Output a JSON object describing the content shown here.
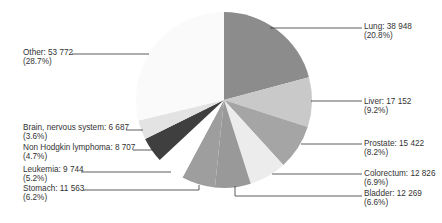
{
  "chart_data": {
    "type": "pie",
    "title": "",
    "center": [
      224,
      100
    ],
    "radius": 88,
    "start_angle_deg": 0,
    "direction": "clockwise",
    "slices": [
      {
        "label": "Lung",
        "value": 38948,
        "value_text": "38 948",
        "percent": 20.8,
        "percent_text": "(20.8%)",
        "color": "#8c8c8c",
        "side": "right",
        "label_x": 364,
        "label_y": 29,
        "line": [
          [
            270,
            28
          ],
          [
            362,
            28
          ]
        ]
      },
      {
        "label": "Liver",
        "value": 17152,
        "value_text": "17 152",
        "percent": 9.2,
        "percent_text": "(9.2%)",
        "color": "#c9c9c9",
        "side": "right",
        "label_x": 364,
        "label_y": 104,
        "line": [
          [
            311,
            101
          ],
          [
            362,
            101
          ]
        ]
      },
      {
        "label": "Prostate",
        "value": 15422,
        "value_text": "15 422",
        "percent": 8.2,
        "percent_text": "(8.2%)",
        "color": "#a5a5a5",
        "side": "right",
        "label_x": 364,
        "label_y": 146,
        "line": [
          [
            301,
            144
          ],
          [
            362,
            144
          ]
        ]
      },
      {
        "label": "Colorectum",
        "value": 12826,
        "value_text": "12 826",
        "percent": 6.9,
        "percent_text": "(6.9%)",
        "color": "#ececec",
        "side": "right",
        "label_x": 364,
        "label_y": 176,
        "line": [
          [
            272,
            174
          ],
          [
            362,
            174
          ]
        ]
      },
      {
        "label": "Bladder",
        "value": 12269,
        "value_text": "12 269",
        "percent": 6.6,
        "percent_text": "(6.6%)",
        "color": "#999999",
        "side": "right",
        "label_x": 364,
        "label_y": 196,
        "line": [
          [
            235,
            186
          ],
          [
            235,
            196
          ],
          [
            362,
            196
          ]
        ]
      },
      {
        "label": "Stomach",
        "value": 11563,
        "value_text": "11 563",
        "percent": 6.2,
        "percent_text": "(6.2%)",
        "color": "#9e9e9e",
        "side": "left",
        "label_x": 23,
        "label_y": 191,
        "line": [
          [
            83,
            190
          ],
          [
            199,
            190
          ],
          [
            199,
            185
          ]
        ]
      },
      {
        "label": "Leukemia",
        "value": 9744,
        "value_text": "9 744",
        "percent": 5.2,
        "percent_text": "(5.2%)",
        "color": "#ffffff",
        "side": "left",
        "label_x": 23,
        "label_y": 172,
        "line": [
          [
            81,
            172
          ],
          [
            171,
            172
          ]
        ]
      },
      {
        "label": "Non Hodgkin lymphoma",
        "value": 8707,
        "value_text": "8 707",
        "percent": 4.7,
        "percent_text": "(4.7%)",
        "color": "#3f3f3f",
        "side": "left",
        "label_x": 23,
        "label_y": 150,
        "line": [
          [
            133,
            150
          ],
          [
            153,
            150
          ]
        ]
      },
      {
        "label": "Brain, nervous system",
        "value": 6687,
        "value_text": "6 687",
        "percent": 3.6,
        "percent_text": "(3.6%)",
        "color": "#e3e3e3",
        "side": "left",
        "label_x": 23,
        "label_y": 130,
        "line": [
          [
            126,
            130
          ],
          [
            143,
            130
          ]
        ]
      },
      {
        "label": "Other",
        "value": 53772,
        "value_text": "53 772",
        "percent": 28.7,
        "percent_text": "(28.7%)",
        "color": "#fafafa",
        "side": "left",
        "label_x": 23,
        "label_y": 55,
        "line": [
          [
            72,
            54
          ],
          [
            149,
            54
          ]
        ]
      }
    ],
    "legend": null,
    "line_color": "#333333"
  }
}
